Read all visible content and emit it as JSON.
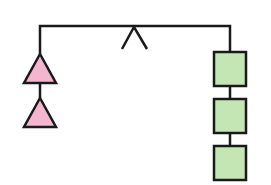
{
  "diagram": {
    "left_side": {
      "shape": "triangle",
      "count": 2,
      "fill": "#f4b6cf"
    },
    "right_side": {
      "shape": "square",
      "count": 3,
      "fill": "#c3e6b4"
    },
    "stroke_color": "#1a1a1a",
    "fulcrum": "inverted-v"
  }
}
